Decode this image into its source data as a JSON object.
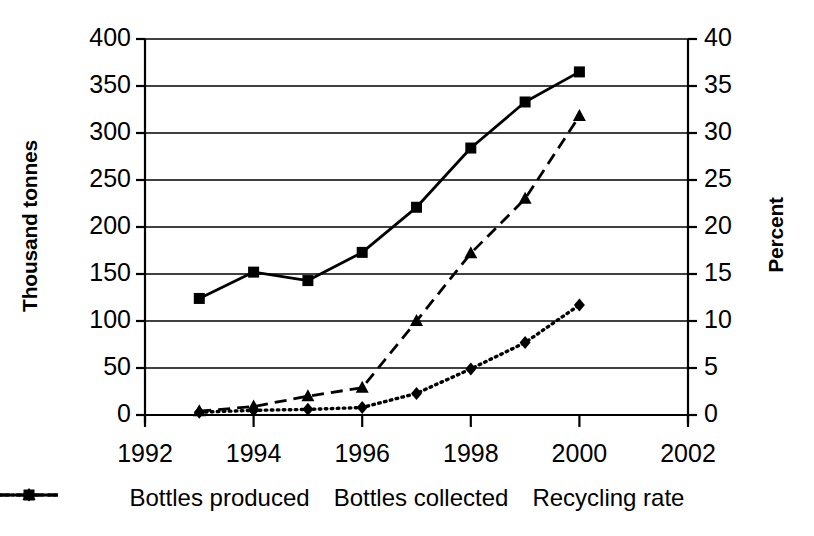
{
  "chart_data": {
    "type": "line",
    "title": "",
    "xlabel": "",
    "ylabel": "Thousand tonnes",
    "y2label": "Percent",
    "x": [
      1993,
      1994,
      1995,
      1996,
      1997,
      1998,
      1999,
      2000
    ],
    "xlim": [
      1992,
      2002
    ],
    "ylim": [
      0,
      400
    ],
    "y2lim": [
      0,
      40
    ],
    "grid": true,
    "legend_position": "bottom",
    "xticks": [
      "1992",
      "1994",
      "1996",
      "1998",
      "2000",
      "2002"
    ],
    "xtick_values": [
      1992,
      1994,
      1996,
      1998,
      2000,
      2002
    ],
    "yticks": [
      "0",
      "50",
      "100",
      "150",
      "200",
      "250",
      "300",
      "350",
      "400"
    ],
    "ytick_values": [
      0,
      50,
      100,
      150,
      200,
      250,
      300,
      350,
      400
    ],
    "y2ticks": [
      "0",
      "5",
      "10",
      "15",
      "20",
      "25",
      "30",
      "35",
      "40"
    ],
    "y2tick_values": [
      0,
      5,
      10,
      15,
      20,
      25,
      30,
      35,
      40
    ],
    "series": [
      {
        "name": "Bottles produced",
        "axis": "left",
        "marker": "diamond",
        "line": "dotted",
        "color": "#000000",
        "values": [
          3,
          5,
          6,
          8,
          23,
          49,
          77,
          117
        ]
      },
      {
        "name": "Bottles collected",
        "axis": "left",
        "marker": "square",
        "line": "solid",
        "color": "#000000",
        "values": [
          124,
          152,
          143,
          173,
          221,
          284,
          333,
          365
        ]
      },
      {
        "name": "Recycling rate",
        "axis": "right",
        "marker": "triangle",
        "line": "dashed",
        "color": "#000000",
        "values": [
          0.4,
          0.9,
          2.0,
          2.9,
          10.0,
          17.2,
          23.0,
          31.8
        ]
      }
    ]
  },
  "legend": {
    "items": [
      {
        "label": "Bottles produced",
        "style": "dotted-diamond"
      },
      {
        "label": "Bottles collected",
        "style": "solid-square"
      },
      {
        "label": "Recycling rate",
        "style": "dashed-triangle"
      }
    ]
  }
}
